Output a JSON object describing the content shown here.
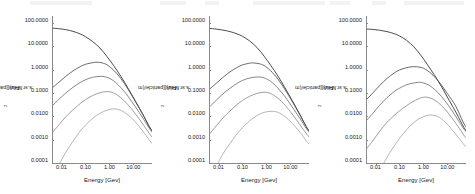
{
  "figure": {
    "panel_count": 3,
    "background": "#ffffff",
    "axis_color": "#8a8a8a",
    "text_color": "#1a1a1a"
  },
  "axes": {
    "xlabel": "Energy [Gev]",
    "ylabel_prefix": "Flux [particle/(m",
    "ylabel_exponent": "2",
    "ylabel_suffix": ".s.sr.MeV)]",
    "ylabel_plain": "Flux [particle/(m2.s.sr.MeV)]",
    "ytick_labels": [
      "100.0000",
      "10.0000",
      "1.0000",
      "0.1000",
      "0.0100",
      "0.0010",
      "0.0001"
    ],
    "ytick_values": [
      100,
      10,
      1,
      0.1,
      0.01,
      0.001,
      0.0001
    ],
    "xtick_labels": [
      "0.01",
      "0.10",
      "1.00",
      "10.00"
    ],
    "xtick_values": [
      0.01,
      0.1,
      1,
      10
    ],
    "xlim": [
      0.004,
      60
    ],
    "ylim": [
      0.0001,
      200
    ],
    "xscale": "log",
    "yscale": "log",
    "grid": false,
    "legend": "none"
  },
  "curve_colors": [
    "#2a2a2a",
    "#4f4f4f",
    "#707070",
    "#8d8d8d",
    "#a8a8a8"
  ],
  "chart_data": [
    {
      "type": "line",
      "panel": 1,
      "title": "",
      "xlabel": "Energy [Gev]",
      "ylabel": "Flux [particle/(m2.s.sr.MeV)]",
      "xscale": "log",
      "yscale": "log",
      "xlim": [
        0.004,
        60
      ],
      "ylim": [
        0.0001,
        200
      ],
      "grid": false,
      "series": [
        {
          "name": "curve-1",
          "color": "#2a2a2a",
          "peak_x": 0.0045,
          "peak_y": 60,
          "x": [
            0.0045,
            0.008,
            0.015,
            0.03,
            0.06,
            0.1,
            0.2,
            0.4,
            0.8,
            1.5,
            3.0,
            6.0,
            12.0,
            25.0,
            45.0,
            60.0
          ],
          "y": [
            60,
            57,
            52,
            44,
            34,
            26,
            16,
            8.5,
            3.6,
            1.5,
            0.52,
            0.16,
            0.046,
            0.012,
            0.0038,
            0.0024
          ]
        },
        {
          "name": "curve-2",
          "color": "#4f4f4f",
          "peak_x": 0.3,
          "peak_y": 2.1,
          "x": [
            0.0045,
            0.008,
            0.015,
            0.03,
            0.06,
            0.1,
            0.2,
            0.3,
            0.5,
            0.8,
            1.5,
            3.0,
            6.0,
            12.0,
            25.0,
            45.0,
            60.0
          ],
          "y": [
            0.18,
            0.3,
            0.52,
            0.88,
            1.35,
            1.7,
            2.0,
            2.1,
            1.95,
            1.6,
            0.95,
            0.42,
            0.145,
            0.044,
            0.012,
            0.0038,
            0.0024
          ]
        },
        {
          "name": "curve-3",
          "color": "#707070",
          "peak_x": 0.45,
          "peak_y": 0.52,
          "x": [
            0.0045,
            0.008,
            0.015,
            0.03,
            0.06,
            0.1,
            0.2,
            0.45,
            0.8,
            1.5,
            3.0,
            6.0,
            12.0,
            25.0,
            45.0,
            60.0
          ],
          "y": [
            0.031,
            0.055,
            0.1,
            0.175,
            0.28,
            0.37,
            0.47,
            0.52,
            0.47,
            0.33,
            0.17,
            0.072,
            0.026,
            0.0085,
            0.0032,
            0.0021
          ]
        },
        {
          "name": "curve-4",
          "color": "#8d8d8d",
          "peak_x": 0.8,
          "peak_y": 0.115,
          "x": [
            0.0045,
            0.008,
            0.015,
            0.03,
            0.06,
            0.1,
            0.2,
            0.4,
            0.8,
            1.5,
            3.0,
            6.0,
            12.0,
            25.0,
            45.0,
            60.0
          ],
          "y": [
            0.0022,
            0.0045,
            0.0095,
            0.019,
            0.035,
            0.052,
            0.078,
            0.103,
            0.115,
            0.1,
            0.063,
            0.031,
            0.013,
            0.0046,
            0.0019,
            0.0013
          ]
        },
        {
          "name": "curve-5",
          "color": "#a8a8a8",
          "peak_x": 1.5,
          "peak_y": 0.021,
          "x": [
            0.0085,
            0.015,
            0.03,
            0.06,
            0.1,
            0.2,
            0.4,
            0.8,
            1.5,
            3.0,
            6.0,
            12.0,
            25.0,
            45.0,
            60.0
          ],
          "y": [
            0.0001,
            0.00028,
            0.00085,
            0.0023,
            0.0042,
            0.0082,
            0.0135,
            0.0185,
            0.021,
            0.018,
            0.0115,
            0.0058,
            0.0023,
            0.001,
            0.0007
          ]
        }
      ]
    },
    {
      "type": "line",
      "panel": 2,
      "title": "",
      "xlabel": "Energy [Gev]",
      "ylabel": "Flux [particle/(m2.s.sr.MeV)]",
      "xscale": "log",
      "yscale": "log",
      "xlim": [
        0.004,
        60
      ],
      "ylim": [
        0.0001,
        200
      ],
      "grid": false,
      "series": [
        {
          "name": "curve-1",
          "color": "#2a2a2a",
          "peak_x": 0.0045,
          "peak_y": 58,
          "x": [
            0.0045,
            0.008,
            0.015,
            0.03,
            0.06,
            0.1,
            0.2,
            0.4,
            0.8,
            1.5,
            3.0,
            6.0,
            12.0,
            25.0,
            45.0,
            60.0
          ],
          "y": [
            58,
            55,
            50,
            43,
            34,
            27,
            17,
            9.0,
            3.8,
            1.55,
            0.54,
            0.165,
            0.047,
            0.012,
            0.0038,
            0.0024
          ]
        },
        {
          "name": "curve-2",
          "color": "#4f4f4f",
          "peak_x": 0.28,
          "peak_y": 1.95,
          "x": [
            0.0045,
            0.008,
            0.015,
            0.03,
            0.06,
            0.1,
            0.2,
            0.28,
            0.5,
            0.8,
            1.5,
            3.0,
            6.0,
            12.0,
            25.0,
            45.0,
            60.0
          ],
          "y": [
            0.155,
            0.26,
            0.46,
            0.8,
            1.25,
            1.6,
            1.9,
            1.95,
            1.8,
            1.5,
            0.9,
            0.4,
            0.14,
            0.043,
            0.0115,
            0.0037,
            0.0024
          ]
        },
        {
          "name": "curve-3",
          "color": "#707070",
          "peak_x": 0.45,
          "peak_y": 0.49,
          "x": [
            0.0045,
            0.008,
            0.015,
            0.03,
            0.06,
            0.1,
            0.2,
            0.45,
            0.8,
            1.5,
            3.0,
            6.0,
            12.0,
            25.0,
            45.0,
            60.0
          ],
          "y": [
            0.027,
            0.049,
            0.09,
            0.16,
            0.26,
            0.345,
            0.44,
            0.49,
            0.445,
            0.315,
            0.163,
            0.069,
            0.025,
            0.0082,
            0.0031,
            0.0021
          ]
        },
        {
          "name": "curve-4",
          "color": "#8d8d8d",
          "peak_x": 0.85,
          "peak_y": 0.108,
          "x": [
            0.0045,
            0.008,
            0.015,
            0.03,
            0.06,
            0.1,
            0.2,
            0.4,
            0.85,
            1.5,
            3.0,
            6.0,
            12.0,
            25.0,
            45.0,
            60.0
          ],
          "y": [
            0.0019,
            0.0039,
            0.0083,
            0.017,
            0.032,
            0.048,
            0.072,
            0.096,
            0.108,
            0.095,
            0.06,
            0.03,
            0.0125,
            0.0044,
            0.0019,
            0.0013
          ]
        },
        {
          "name": "curve-5",
          "color": "#a8a8a8",
          "peak_x": 1.7,
          "peak_y": 0.0165,
          "x": [
            0.0095,
            0.015,
            0.03,
            0.06,
            0.1,
            0.2,
            0.4,
            0.8,
            1.7,
            3.0,
            6.0,
            12.0,
            25.0,
            45.0,
            60.0
          ],
          "y": [
            0.0001,
            0.00024,
            0.00068,
            0.0018,
            0.0033,
            0.0064,
            0.0108,
            0.0148,
            0.0165,
            0.0148,
            0.0098,
            0.005,
            0.0021,
            0.00092,
            0.00065
          ]
        }
      ]
    },
    {
      "type": "line",
      "panel": 3,
      "title": "",
      "xlabel": "Energy [Gev]",
      "ylabel": "Flux [particle/(m2.s.sr.MeV)]",
      "xscale": "log",
      "yscale": "log",
      "xlim": [
        0.004,
        60
      ],
      "ylim": [
        0.0001,
        200
      ],
      "grid": false,
      "series": [
        {
          "name": "curve-1",
          "color": "#2a2a2a",
          "peak_x": 0.0045,
          "peak_y": 55,
          "x": [
            0.0045,
            0.008,
            0.015,
            0.03,
            0.06,
            0.1,
            0.2,
            0.4,
            0.8,
            1.5,
            3.0,
            6.0,
            12.0,
            25.0,
            45.0,
            60.0
          ],
          "y": [
            55,
            53,
            49,
            43,
            35,
            28,
            18,
            9.5,
            4.0,
            1.6,
            0.55,
            0.17,
            0.048,
            0.0125,
            0.0039,
            0.0025
          ]
        },
        {
          "name": "curve-2",
          "color": "#4f4f4f",
          "peak_x": 0.38,
          "peak_y": 1.35,
          "x": [
            0.0045,
            0.008,
            0.015,
            0.03,
            0.06,
            0.1,
            0.2,
            0.38,
            0.7,
            1.2,
            2.5,
            5.0,
            10.0,
            22.0,
            45.0,
            60.0
          ],
          "y": [
            0.056,
            0.105,
            0.21,
            0.42,
            0.72,
            0.97,
            1.22,
            1.35,
            1.28,
            1.05,
            0.58,
            0.26,
            0.095,
            0.028,
            0.0058,
            0.0035
          ]
        },
        {
          "name": "curve-3",
          "color": "#707070",
          "peak_x": 0.55,
          "peak_y": 0.285,
          "x": [
            0.0045,
            0.008,
            0.015,
            0.03,
            0.06,
            0.1,
            0.2,
            0.55,
            1.0,
            2.0,
            4.0,
            8.0,
            16.0,
            32.0,
            50.0,
            60.0
          ],
          "y": [
            0.0072,
            0.014,
            0.03,
            0.063,
            0.115,
            0.16,
            0.225,
            0.285,
            0.27,
            0.195,
            0.105,
            0.046,
            0.017,
            0.0055,
            0.0028,
            0.0022
          ]
        },
        {
          "name": "curve-4",
          "color": "#8d8d8d",
          "peak_x": 1.0,
          "peak_y": 0.066,
          "x": [
            0.0045,
            0.008,
            0.015,
            0.03,
            0.06,
            0.1,
            0.2,
            0.45,
            1.0,
            2.0,
            4.0,
            8.0,
            16.0,
            32.0,
            50.0,
            60.0
          ],
          "y": [
            0.00044,
            0.00095,
            0.0023,
            0.0055,
            0.011,
            0.017,
            0.029,
            0.048,
            0.066,
            0.06,
            0.04,
            0.02,
            0.0082,
            0.003,
            0.0015,
            0.0012
          ]
        },
        {
          "name": "curve-5",
          "color": "#a8a8a8",
          "peak_x": 2.0,
          "peak_y": 0.0115,
          "x": [
            0.022,
            0.04,
            0.08,
            0.15,
            0.3,
            0.6,
            1.2,
            2.0,
            4.0,
            8.0,
            16.0,
            32.0,
            50.0,
            60.0
          ],
          "y": [
            0.0001,
            0.00028,
            0.00082,
            0.0019,
            0.0042,
            0.0075,
            0.0103,
            0.0115,
            0.0098,
            0.0058,
            0.0026,
            0.0011,
            0.0006,
            0.00048
          ]
        }
      ]
    }
  ]
}
